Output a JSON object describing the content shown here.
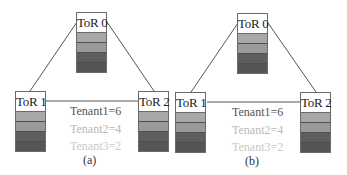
{
  "colors": {
    "line": "#555555",
    "stripe_light": "#a8a8a8",
    "stripe_mid": "#9a9a9a",
    "stripe_dark": "#5c5c5c",
    "stripe_darker": "#555555",
    "tenant1": "#555555",
    "tenant2": "#b8b8b8",
    "tenant3": "#c8c8c8"
  },
  "panels": [
    {
      "caption": "(a)",
      "tors": [
        {
          "label": "ToR 0"
        },
        {
          "label": "ToR 1"
        },
        {
          "label": "ToR 2"
        }
      ],
      "tenants": [
        "Tenant1=6",
        "Tenant2=4",
        "Tenant3=2"
      ]
    },
    {
      "caption": "(b)",
      "tors": [
        {
          "label": "ToR 0"
        },
        {
          "label": "ToR 1"
        },
        {
          "label": "ToR 2"
        }
      ],
      "tenants": [
        "Tenant1=6",
        "Tenant2=4",
        "Tenant3=2"
      ]
    }
  ]
}
